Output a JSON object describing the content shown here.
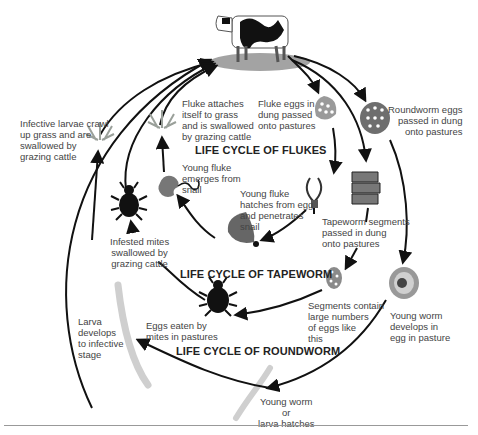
{
  "titles": {
    "flukes": "LIFE CYCLE OF FLUKES",
    "tapeworm": "LIFE CYCLE OF TAPEWORM",
    "roundworm": "LIFE CYCLE OF ROUNDWORM"
  },
  "labels": {
    "infective_larvae": "Infective larvae crawl\nup grass and are\nswallowed by\ngrazing cattle",
    "fluke_attaches": "Fluke attaches\nitself to grass\nand is swallowed\nby grazing cattle",
    "fluke_eggs": "Fluke eggs in\ndung passed\nonto pastures",
    "roundworm_eggs": "Roundworm eggs\npassed in dung\nonto pastures",
    "young_fluke_emerges": "Young fluke\nemerges from\nsnail",
    "young_fluke_hatches": "Young fluke\nhatches from egg\nand penetrates\nsnail",
    "tapeworm_segments": "Tapeworm segments\npassed in dung\nonto pastures",
    "infested_mites": "Infested mites\nswallowed by\ngrazing cattle",
    "segments_contain": "Segments contain\nlarge numbers\nof eggs like\nthis",
    "young_worm_develops": "Young worm\ndevelops in\negg in pasture",
    "larva_develops": "Larva\ndevelops\nto infective\nstage",
    "eggs_eaten": "Eggs eaten by\nmites in pastures",
    "young_worm_hatches": "Young worm\nor\nlarva hatches"
  },
  "icons": [
    "cow-icon",
    "grass-icon",
    "mite-icon",
    "snail-icon",
    "fluke-larva-icon",
    "fluke-egg-icon",
    "roundworm-egg-icon",
    "tapeworm-segments-icon",
    "tapeworm-egg-icon",
    "developing-egg-icon",
    "larva-worm-icon"
  ],
  "colors": {
    "arrow": "#111111",
    "egg_fill": "#8a8a8a",
    "grass": "#9aa09a",
    "worm": "#cfcfcf",
    "text": "#444444"
  }
}
